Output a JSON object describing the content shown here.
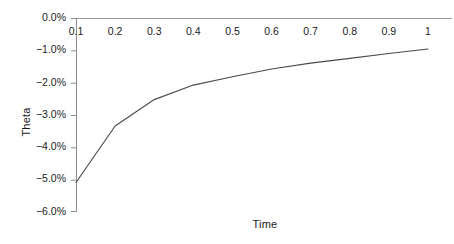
{
  "chart_data": {
    "type": "line",
    "title": "",
    "xlabel": "Time",
    "ylabel": "Theta",
    "x": [
      0.1,
      0.2,
      0.3,
      0.4,
      0.5,
      0.6,
      0.7,
      0.8,
      0.9,
      1.0
    ],
    "values": [
      -5.1,
      -3.35,
      -2.53,
      -2.08,
      -1.82,
      -1.58,
      -1.4,
      -1.25,
      -1.1,
      -0.96
    ],
    "series": [
      {
        "name": "Theta",
        "values": [
          -5.1,
          -3.35,
          -2.53,
          -2.08,
          -1.82,
          -1.58,
          -1.4,
          -1.25,
          -1.1,
          -0.96
        ],
        "color": "#4a4a4a"
      }
    ],
    "xtick_labels": [
      "0.1",
      "0.2",
      "0.3",
      "0.4",
      "0.5",
      "0.6",
      "0.7",
      "0.8",
      "0.9",
      "1"
    ],
    "ytick_labels": [
      "0.0%",
      "−1.0%",
      "−2.0%",
      "−3.0%",
      "−4.0%",
      "−5.0%",
      "−6.0%"
    ],
    "ytick_values": [
      0,
      -1,
      -2,
      -3,
      -4,
      -5,
      -6
    ],
    "xlim": [
      0.1,
      1.0
    ],
    "ylim": [
      -6,
      0
    ],
    "grid": false,
    "legend": false,
    "legend_position": "none",
    "axis_color": "#9a9a9a",
    "line_color": "#4a4a4a",
    "text_color": "#1a1a1a",
    "background": "#ffffff",
    "xaxis_position": "top",
    "value_unit": "percent"
  }
}
